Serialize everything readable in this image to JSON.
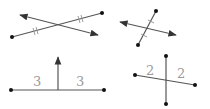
{
  "colors": {
    "line": "#555555",
    "tick": "#9a9a9a",
    "label": "#9a9a9a",
    "dot": "#111111"
  },
  "panels": [
    {
      "id": "bisector-not-perpendicular",
      "segment": {
        "x1": 12,
        "y1": 37,
        "x2": 102,
        "y2": 13
      },
      "line": {
        "x1": 20,
        "y1": 15,
        "x2": 98,
        "y2": 35
      },
      "ticks": "double"
    },
    {
      "id": "perpendicular-not-bisector-marks",
      "segment": {
        "x1": 156,
        "y1": 11,
        "x2": 138,
        "y2": 45
      },
      "line": {
        "x1": 120,
        "y1": 22,
        "x2": 176,
        "y2": 35
      },
      "ticks": "single"
    },
    {
      "id": "perpendicular-ray-equal-parts",
      "segment": {
        "x1": 11,
        "y1": 90,
        "x2": 104,
        "y2": 90
      },
      "ray": {
        "x1": 58,
        "y1": 90,
        "x2": 58,
        "y2": 57
      },
      "labels": [
        {
          "text": "3",
          "x": 33,
          "y": 86
        },
        {
          "text": "3",
          "x": 76,
          "y": 86
        }
      ]
    },
    {
      "id": "bisecting-segments",
      "segment": {
        "x1": 135,
        "y1": 75,
        "x2": 195,
        "y2": 85
      },
      "segment2": {
        "x1": 166,
        "y1": 56,
        "x2": 166,
        "y2": 104
      },
      "labels": [
        {
          "text": "2",
          "x": 146,
          "y": 75
        },
        {
          "text": "2",
          "x": 177,
          "y": 78
        }
      ]
    }
  ]
}
